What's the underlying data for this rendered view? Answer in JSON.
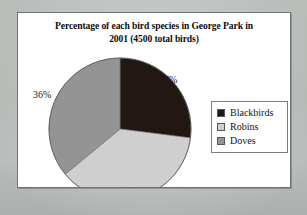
{
  "figure": {
    "background_color": "#c9ccc9",
    "panel_color": "#ffffff",
    "panel_border_color": "#6e7270"
  },
  "chart_data": {
    "type": "pie",
    "title": "Percentage of each bird species in George Park in 2001 (4500 total birds)",
    "title_line_1": "Percentage of each bird species in George Park in",
    "title_line_2": "2001 (4500 total birds)",
    "total_birds": 4500,
    "categories": [
      "Blackbirds",
      "Robins",
      "Doves"
    ],
    "values": [
      27,
      37,
      36
    ],
    "value_labels": [
      "27%",
      "36%",
      "37%"
    ],
    "units": "percent",
    "start_angle_deg": 0,
    "direction": "clockwise",
    "legend_position": "right",
    "slices": [
      {
        "name": "Blackbirds",
        "value": 27,
        "label": "27%",
        "color": "#231714",
        "start_deg": 0,
        "end_deg": 97.2
      },
      {
        "name": "Robins",
        "value": 37,
        "label": "37%",
        "color": "#cfcfcf",
        "start_deg": 97.2,
        "end_deg": 230.4
      },
      {
        "name": "Doves",
        "value": 36,
        "label": "36%",
        "color": "#949494",
        "start_deg": 230.4,
        "end_deg": 360
      }
    ]
  },
  "legend": {
    "items": [
      {
        "label": "Blackbirds",
        "color": "#231714"
      },
      {
        "label": "Robins",
        "color": "#cfcfcf"
      },
      {
        "label": "Doves",
        "color": "#949494"
      }
    ]
  }
}
